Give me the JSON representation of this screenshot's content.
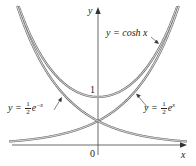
{
  "chart_data": {
    "type": "line",
    "title": "",
    "xlabel": "x",
    "ylabel": "y",
    "xlim": [
      -2.1,
      1.9
    ],
    "ylim": [
      0,
      2.85
    ],
    "grid": false,
    "legend": "inline labels with arrows",
    "tick_labels": {
      "origin": "0",
      "y_tick": "1"
    },
    "series": [
      {
        "name": "y = cosh x",
        "function": "cosh(x)",
        "x": [
          -1.7,
          -1.5,
          -1,
          -0.5,
          0,
          0.5,
          1,
          1.5,
          1.7
        ],
        "values": [
          2.83,
          2.35,
          1.54,
          1.13,
          1.0,
          1.13,
          1.54,
          2.35,
          2.83
        ]
      },
      {
        "name": "y = 1/2 e^x",
        "function": "0.5*exp(x)",
        "x": [
          -2,
          -1.5,
          -1,
          -0.5,
          0,
          0.5,
          1,
          1.5,
          1.73
        ],
        "values": [
          0.07,
          0.11,
          0.18,
          0.3,
          0.5,
          0.82,
          1.36,
          2.24,
          2.82
        ]
      },
      {
        "name": "y = 1/2 e^-x",
        "function": "0.5*exp(-x)",
        "x": [
          -1.73,
          -1.5,
          -1,
          -0.5,
          0,
          0.5,
          1,
          1.5,
          1.9
        ],
        "values": [
          2.82,
          2.24,
          1.36,
          0.82,
          0.5,
          0.3,
          0.18,
          0.11,
          0.07
        ]
      }
    ],
    "annotations": [
      "y = cosh x",
      "y = 1/2 e^x",
      "y = 1/2 e^-x"
    ]
  },
  "labels": {
    "y_axis": "y",
    "x_axis": "x",
    "origin": "0",
    "one": "1",
    "cosh_prefix": "y = cosh ",
    "cosh_var": "x",
    "exp_pos_prefix": "y = ",
    "exp_neg_prefix": "y = ",
    "half_num": "1",
    "half_den": "2",
    "e": "e",
    "exp_pos_power": "x",
    "exp_neg_power": "−x"
  },
  "colors": {
    "curve": "#6b6b6b",
    "axis": "#333333",
    "text": "#222222"
  }
}
